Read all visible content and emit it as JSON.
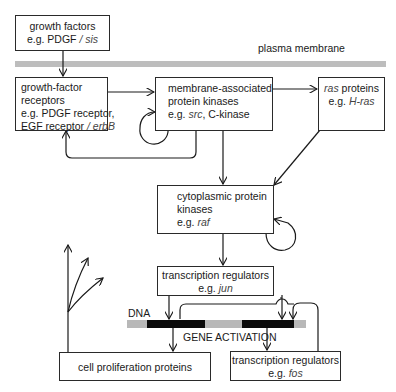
{
  "diagram": {
    "membrane_label": "plasma membrane",
    "dna_label": "DNA",
    "gene_activation_label": "GENE ACTIVATION",
    "nodes": {
      "growth_factors": {
        "line1": "growth factors",
        "line2_prefix": "e.g. PDGF ",
        "line2_italic": "/ sis"
      },
      "receptors": {
        "line1": "growth-factor",
        "line2": "receptors",
        "line3": "e.g. PDGF receptor,",
        "line4_prefix": "EGF receptor ",
        "line4_italic": "/ erbB"
      },
      "membrane_kinases": {
        "line1": "membrane-associated",
        "line2": "protein kinases",
        "line3_prefix": "e.g. ",
        "line3_italic": "src",
        "line3_suffix": ", C-kinase"
      },
      "ras": {
        "line1_italic": "ras",
        "line1_suffix": " proteins",
        "line2_prefix": "e.g. ",
        "line2_italic": "H-ras"
      },
      "cytoplasmic_kinases": {
        "line1": "cytoplasmic protein",
        "line2": "kinases",
        "line3_prefix": "e.g. ",
        "line3_italic": "raf"
      },
      "jun": {
        "line1": "transcription regulators",
        "line2_prefix": "e.g. ",
        "line2_italic": "jun"
      },
      "cell_proliferation": {
        "line1": "cell proliferation proteins"
      },
      "fos": {
        "line1": "transcription regulators",
        "line2_prefix": "e.g. ",
        "line2_italic": "fos"
      }
    },
    "edges": [
      {
        "from": "growth_factors",
        "to": "receptors"
      },
      {
        "from": "receptors",
        "to": "membrane_kinases"
      },
      {
        "from": "membrane_kinases",
        "to": "membrane_kinases",
        "type": "self-loop"
      },
      {
        "from": "membrane_kinases",
        "to": "receptors",
        "type": "feedback"
      },
      {
        "from": "membrane_kinases",
        "to": "ras"
      },
      {
        "from": "membrane_kinases",
        "to": "cytoplasmic_kinases"
      },
      {
        "from": "ras",
        "to": "cytoplasmic_kinases"
      },
      {
        "from": "cytoplasmic_kinases",
        "to": "cytoplasmic_kinases",
        "type": "self-loop"
      },
      {
        "from": "cytoplasmic_kinases",
        "to": "jun"
      },
      {
        "from": "jun",
        "to": "DNA"
      },
      {
        "from": "fos",
        "to": "DNA"
      },
      {
        "from": "DNA",
        "to": "cell_proliferation"
      },
      {
        "from": "DNA",
        "to": "fos"
      },
      {
        "from": "cell_proliferation",
        "to": "branching-arrows"
      }
    ],
    "colors": {
      "line": "#1a1a1a",
      "membrane": "#bdbdbd",
      "dna_dark": "#0a0a0a",
      "dna_light": "#b8b8b8"
    }
  }
}
